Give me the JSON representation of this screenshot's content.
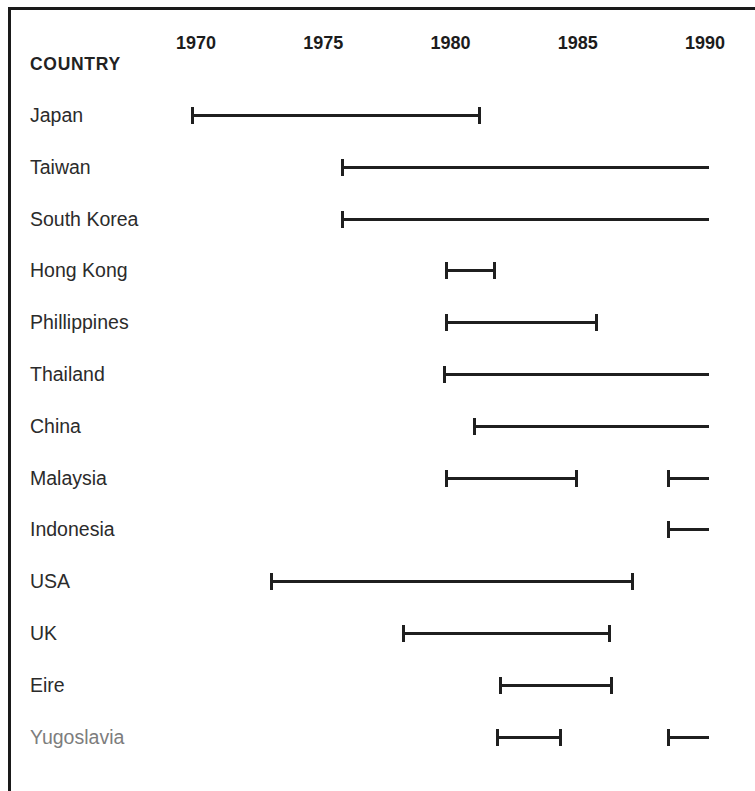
{
  "chart_data": {
    "type": "bar",
    "title": "",
    "subtitle": "",
    "xlabel": "",
    "ylabel": "COUNTRY",
    "orientation": "horizontal-timeline",
    "grid": false,
    "legend": null,
    "xlim": [
      1968.0,
      1990.5
    ],
    "axis_ticks": [
      1970,
      1975,
      1980,
      1985,
      1990
    ],
    "axis_tick_labels": [
      "1970",
      "1975",
      "1980",
      "1985",
      "1990"
    ],
    "categories": [
      "Japan",
      "Taiwan",
      "South Korea",
      "Hong Kong",
      "Phillippines",
      "Thailand",
      "China",
      "Malaysia",
      "Indonesia",
      "USA",
      "UK",
      "Eire",
      "Yugoslavia"
    ],
    "series": [
      {
        "name": "Japan",
        "intervals": [
          {
            "start": 1969.8,
            "end": 1981.2,
            "start_cap": true,
            "end_cap": true
          }
        ]
      },
      {
        "name": "Taiwan",
        "intervals": [
          {
            "start": 1975.7,
            "end": 1990.5,
            "start_cap": true,
            "end_cap": false
          }
        ]
      },
      {
        "name": "South Korea",
        "intervals": [
          {
            "start": 1975.7,
            "end": 1990.5,
            "start_cap": true,
            "end_cap": false
          }
        ]
      },
      {
        "name": "Hong Kong",
        "intervals": [
          {
            "start": 1979.8,
            "end": 1981.8,
            "start_cap": true,
            "end_cap": true
          }
        ]
      },
      {
        "name": "Phillippines",
        "intervals": [
          {
            "start": 1979.8,
            "end": 1985.8,
            "start_cap": true,
            "end_cap": true
          }
        ]
      },
      {
        "name": "Thailand",
        "intervals": [
          {
            "start": 1979.7,
            "end": 1990.5,
            "start_cap": true,
            "end_cap": false
          }
        ]
      },
      {
        "name": "China",
        "intervals": [
          {
            "start": 1980.9,
            "end": 1990.5,
            "start_cap": true,
            "end_cap": false
          }
        ]
      },
      {
        "name": "Malaysia",
        "intervals": [
          {
            "start": 1979.8,
            "end": 1985.0,
            "start_cap": true,
            "end_cap": true
          },
          {
            "start": 1988.5,
            "end": 1990.5,
            "start_cap": true,
            "end_cap": false
          }
        ]
      },
      {
        "name": "Indonesia",
        "intervals": [
          {
            "start": 1988.5,
            "end": 1990.5,
            "start_cap": true,
            "end_cap": false
          }
        ]
      },
      {
        "name": "USA",
        "intervals": [
          {
            "start": 1972.9,
            "end": 1987.2,
            "start_cap": true,
            "end_cap": true
          }
        ]
      },
      {
        "name": "UK",
        "intervals": [
          {
            "start": 1978.1,
            "end": 1986.3,
            "start_cap": true,
            "end_cap": true
          }
        ]
      },
      {
        "name": "Eire",
        "intervals": [
          {
            "start": 1981.9,
            "end": 1986.4,
            "start_cap": true,
            "end_cap": true
          }
        ]
      },
      {
        "name": "Yugoslavia",
        "intervals": [
          {
            "start": 1981.8,
            "end": 1984.4,
            "start_cap": true,
            "end_cap": true
          },
          {
            "start": 1988.5,
            "end": 1990.5,
            "start_cap": true,
            "end_cap": false
          }
        ]
      }
    ]
  },
  "header": {
    "country_label": "COUNTRY"
  },
  "rows": [
    {
      "label": "Japan",
      "muted": false
    },
    {
      "label": "Taiwan",
      "muted": false
    },
    {
      "label": "South Korea",
      "muted": false
    },
    {
      "label": "Hong Kong",
      "muted": false
    },
    {
      "label": "Phillippines",
      "muted": false
    },
    {
      "label": "Thailand",
      "muted": false
    },
    {
      "label": "China",
      "muted": false
    },
    {
      "label": "Malaysia",
      "muted": false
    },
    {
      "label": "Indonesia",
      "muted": false
    },
    {
      "label": "USA",
      "muted": false
    },
    {
      "label": "UK",
      "muted": false
    },
    {
      "label": "Eire",
      "muted": false
    },
    {
      "label": "Yugoslavia",
      "muted": true
    }
  ],
  "style": {
    "bar_color": "#1f1f1f",
    "text_color": "#2b2b2b",
    "muted_text_color": "#7d7d7d",
    "background": "#ffffff",
    "rule_color": "#1a1a1a"
  },
  "geometry": {
    "x_1970_px": 196,
    "px_per_year": 25.45,
    "row_label_x_px": 30,
    "first_row_center_y_px": 115,
    "row_spacing_px": 51.8,
    "clip_right_px": 709
  }
}
